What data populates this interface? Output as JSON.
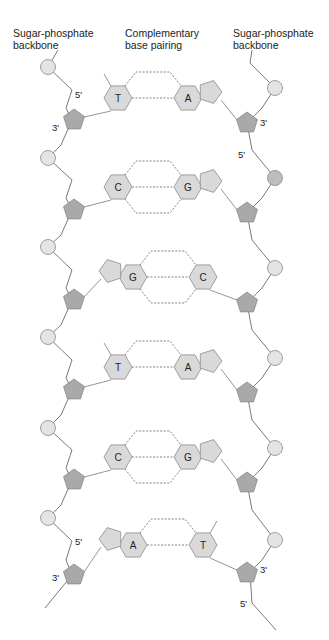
{
  "labels": {
    "left_backbone": [
      "Sugar-phosphate",
      "backbone"
    ],
    "center": [
      "Complementary",
      "base pairing"
    ],
    "right_backbone": [
      "Sugar-phosphate",
      "backbone"
    ]
  },
  "ends": {
    "top_left_5": "5'",
    "top_left_3": "3'",
    "top_right_3": "3'",
    "top_right_5": "5'",
    "bottom_left_5": "5'",
    "bottom_left_3": "3'",
    "bottom_right_3": "3'",
    "bottom_right_5": "5'"
  },
  "base_pairs": [
    {
      "left": "T",
      "right": "A",
      "bonds": 2
    },
    {
      "left": "C",
      "right": "G",
      "bonds": 3
    },
    {
      "left": "G",
      "right": "C",
      "bonds": 3
    },
    {
      "left": "T",
      "right": "A",
      "bonds": 2
    },
    {
      "left": "C",
      "right": "G",
      "bonds": 3
    },
    {
      "left": "A",
      "right": "T",
      "bonds": 2
    }
  ],
  "colors": {
    "phosphate": "#e4e4e4",
    "phosphate_highlight": "#bdbdbd",
    "sugar": "#a9a9a9",
    "base": "#d9d9d9",
    "stroke": "#8a8a8a",
    "line": "#7a7a7a"
  }
}
